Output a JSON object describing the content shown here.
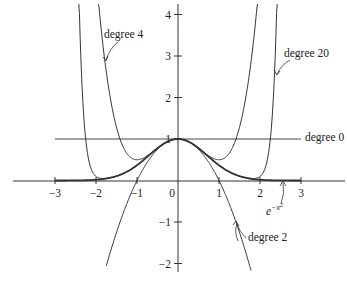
{
  "chart_data": {
    "type": "line",
    "title": "",
    "xlabel": "",
    "ylabel": "",
    "xlim": [
      -4.1,
      4.1
    ],
    "ylim": [
      -2.2,
      4.2
    ],
    "grid": false,
    "x_ticks": [
      -3,
      -2,
      -1,
      0,
      1,
      2,
      3
    ],
    "x_tick_labels": [
      "−3",
      "−2",
      "−1",
      "0",
      "1",
      "2",
      "3"
    ],
    "y_ticks": [
      -2,
      -1,
      1,
      2,
      3,
      4
    ],
    "y_tick_labels": [
      "−2",
      "−1",
      "1",
      "2",
      "3",
      "4"
    ],
    "function": "e^{-x^2}",
    "series": [
      {
        "name": "degree 0",
        "formula": "1",
        "x_range": [
          -3,
          3
        ],
        "label": "degree 0"
      },
      {
        "name": "degree 2",
        "formula": "1 - x^2",
        "x_range": [
          -1.75,
          1.78
        ],
        "label": "degree 2"
      },
      {
        "name": "degree 4",
        "formula": "1 - x^2 + x^4/2",
        "x_range": [
          -1.94,
          1.94
        ],
        "label": "degree 4"
      },
      {
        "name": "degree 20",
        "formula": "sum_{k=0}^{10} (-1)^k x^{2k}/k!",
        "x_range": [
          -2.42,
          2.42
        ],
        "label": "degree 20"
      },
      {
        "name": "e^{-x^2}",
        "formula": "exp(-x^2)",
        "x_range": [
          -3,
          3
        ],
        "label": "e^{-x²}",
        "bold": true
      }
    ],
    "annotations": [
      {
        "text": "degree 4",
        "points_to_series": "degree 4"
      },
      {
        "text": "degree 20",
        "points_to_series": "degree 20"
      },
      {
        "text": "degree 0",
        "points_to_series": "degree 0"
      },
      {
        "text": "degree 2",
        "points_to_series": "degree 2"
      },
      {
        "text": "e^{-x^2}",
        "points_to_series": "e^{-x^2}"
      }
    ]
  },
  "labels": {
    "degree4": "degree 4",
    "degree20": "degree 20",
    "degree0": "degree 0",
    "degree2": "degree 2",
    "gauss_base": "e",
    "gauss_exp": "−x",
    "gauss_exp2": "2"
  }
}
